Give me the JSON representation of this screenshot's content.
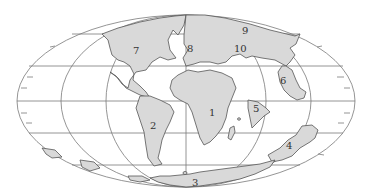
{
  "map": {
    "projection": "elliptical (Mollweide-style) world map",
    "colors": {
      "background": "#ffffff",
      "land": "#d9d9d9",
      "coastline": "#555555",
      "grid": "#7a7a7a",
      "label": "#333333"
    },
    "labels": [
      {
        "id": "1",
        "text": "1",
        "x": 212,
        "y": 115
      },
      {
        "id": "2",
        "text": "2",
        "x": 153,
        "y": 127
      },
      {
        "id": "3",
        "text": "3",
        "x": 195,
        "y": 184
      },
      {
        "id": "4",
        "text": "4",
        "x": 289,
        "y": 147
      },
      {
        "id": "5",
        "text": "5",
        "x": 256,
        "y": 110
      },
      {
        "id": "6",
        "text": "6",
        "x": 283,
        "y": 82
      },
      {
        "id": "7",
        "text": "7",
        "x": 136,
        "y": 55
      },
      {
        "id": "8",
        "text": "8",
        "x": 190,
        "y": 50
      },
      {
        "id": "9",
        "text": "9",
        "x": 245,
        "y": 34
      },
      {
        "id": "10",
        "text": "10",
        "x": 237,
        "y": 50
      }
    ]
  }
}
